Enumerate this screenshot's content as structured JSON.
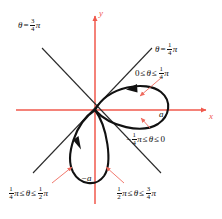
{
  "figure": {
    "type": "polar-curve-diagram",
    "axes": {
      "x_label": "x",
      "y_label": "y",
      "origin": [
        95,
        110
      ],
      "color": "#f0594c"
    },
    "amplitude_labels": [
      {
        "name": "a-label",
        "text": "a",
        "x": 159,
        "y": 110
      },
      {
        "name": "negative-a-label",
        "text": "−a",
        "x": 81,
        "y": 174
      }
    ],
    "ray_labels": [
      {
        "name": "theta-three-quarter-pi",
        "x": 18,
        "y": 18,
        "parts": [
          {
            "kind": "text",
            "value": "θ",
            "italic": true
          },
          {
            "kind": "rel",
            "value": "="
          },
          {
            "kind": "frac",
            "num": "3",
            "den": "4"
          },
          {
            "kind": "text",
            "value": "π",
            "italic": true
          }
        ]
      },
      {
        "name": "theta-quarter-pi",
        "x": 155,
        "y": 42,
        "parts": [
          {
            "kind": "text",
            "value": "θ",
            "italic": true
          },
          {
            "kind": "rel",
            "value": "="
          },
          {
            "kind": "frac",
            "num": "1",
            "den": "4"
          },
          {
            "kind": "text",
            "value": "π",
            "italic": true
          }
        ]
      }
    ],
    "range_labels": [
      {
        "name": "range-first-petal-upper",
        "x": 135,
        "y": 66,
        "parts": [
          {
            "kind": "text",
            "value": "0"
          },
          {
            "kind": "rel",
            "value": "≤"
          },
          {
            "kind": "text",
            "value": "θ",
            "italic": true
          },
          {
            "kind": "rel",
            "value": "≤"
          },
          {
            "kind": "frac",
            "num": "1",
            "den": "4"
          },
          {
            "kind": "text",
            "value": "π",
            "italic": true
          }
        ]
      },
      {
        "name": "range-first-petal-lower",
        "x": 126,
        "y": 132,
        "parts": [
          {
            "kind": "text",
            "value": "−"
          },
          {
            "kind": "frac",
            "num": "1",
            "den": "4"
          },
          {
            "kind": "text",
            "value": "π",
            "italic": true
          },
          {
            "kind": "rel",
            "value": "≤"
          },
          {
            "kind": "text",
            "value": "θ",
            "italic": true
          },
          {
            "kind": "rel",
            "value": "≤"
          },
          {
            "kind": "text",
            "value": "0"
          }
        ]
      },
      {
        "name": "range-second-petal-left",
        "x": 8,
        "y": 186,
        "parts": [
          {
            "kind": "frac",
            "num": "1",
            "den": "4"
          },
          {
            "kind": "text",
            "value": "π",
            "italic": true
          },
          {
            "kind": "rel",
            "value": "≤"
          },
          {
            "kind": "text",
            "value": "θ",
            "italic": true
          },
          {
            "kind": "rel",
            "value": "≤"
          },
          {
            "kind": "frac",
            "num": "1",
            "den": "2"
          },
          {
            "kind": "text",
            "value": "π",
            "italic": true
          }
        ]
      },
      {
        "name": "range-second-petal-right",
        "x": 116,
        "y": 186,
        "parts": [
          {
            "kind": "frac",
            "num": "1",
            "den": "2"
          },
          {
            "kind": "text",
            "value": "π",
            "italic": true
          },
          {
            "kind": "rel",
            "value": "≤"
          },
          {
            "kind": "text",
            "value": "θ",
            "italic": true
          },
          {
            "kind": "rel",
            "value": "≤"
          },
          {
            "kind": "frac",
            "num": "3",
            "den": "4"
          },
          {
            "kind": "text",
            "value": "π",
            "italic": true
          }
        ]
      }
    ],
    "colors": {
      "axis": "#f0594c",
      "pointer": "#ef6a5e",
      "curve": "#111111",
      "ray": "#2b2b2b",
      "text": "#111111"
    }
  }
}
